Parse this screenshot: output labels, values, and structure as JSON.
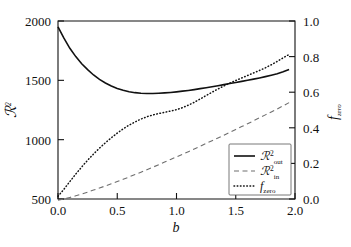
{
  "figure": {
    "background": "#ffffff",
    "foreground": "#111111",
    "dashed_color": "#6f6f6f"
  },
  "axes": {
    "left": {
      "label": "ℛ²",
      "label_base": "ℛ",
      "label_sup": "2",
      "ticks": [
        "500",
        "1000",
        "1500",
        "2000"
      ],
      "tick_values": [
        500,
        1000,
        1500,
        2000
      ],
      "min": 500,
      "max": 2000
    },
    "right": {
      "label_base": "f",
      "label_sub": "zero",
      "ticks": [
        "0.0",
        "0.2",
        "0.4",
        "0.6",
        "0.8",
        "1.0"
      ],
      "tick_values": [
        0.0,
        0.2,
        0.4,
        0.6,
        0.8,
        1.0
      ],
      "min": 0.0,
      "max": 1.0
    },
    "bottom": {
      "label": "b",
      "ticks": [
        "0.0",
        "0.5",
        "1.0",
        "1.5",
        "2.0"
      ],
      "tick_values": [
        0.0,
        0.5,
        1.0,
        1.5,
        2.0
      ],
      "min": 0.0,
      "max": 2.0
    }
  },
  "legend": {
    "position": "lower-right",
    "entries": [
      {
        "style": "solid",
        "base": "ℛ",
        "sup": "2",
        "sub": "out",
        "label": "ℛ²_out"
      },
      {
        "style": "dashed",
        "base": "ℛ",
        "sup": "2",
        "sub": "in",
        "label": "ℛ²_in"
      },
      {
        "style": "dotted",
        "base": "f",
        "sup": "",
        "sub": "zero",
        "label": "f_zero"
      }
    ]
  },
  "chart_data": {
    "type": "line",
    "title": "",
    "xlabel": "b",
    "ylabel": "ℛ²",
    "y2label": "f_zero",
    "xlim": [
      0.0,
      2.0
    ],
    "ylim": [
      500,
      2000
    ],
    "y2lim": [
      0.0,
      1.0
    ],
    "grid": false,
    "legend_position": "lower-right",
    "x": [
      0.0,
      0.05,
      0.1,
      0.15,
      0.2,
      0.25,
      0.3,
      0.35,
      0.4,
      0.45,
      0.5,
      0.55,
      0.6,
      0.65,
      0.7,
      0.75,
      0.8,
      0.85,
      0.9,
      0.95,
      1.0,
      1.05,
      1.1,
      1.15,
      1.2,
      1.25,
      1.3,
      1.35,
      1.4,
      1.45,
      1.5,
      1.55,
      1.6,
      1.65,
      1.7,
      1.75,
      1.8,
      1.85,
      1.9,
      1.95
    ],
    "series": [
      {
        "name": "ℛ²_out",
        "style": "solid",
        "axis": "left",
        "values": [
          1950,
          1855,
          1770,
          1700,
          1640,
          1590,
          1545,
          1508,
          1478,
          1453,
          1432,
          1416,
          1404,
          1396,
          1391,
          1389,
          1389,
          1391,
          1394,
          1398,
          1403,
          1409,
          1415,
          1422,
          1430,
          1438,
          1446,
          1455,
          1464,
          1473,
          1482,
          1491,
          1500,
          1510,
          1520,
          1531,
          1543,
          1556,
          1572,
          1592
        ]
      },
      {
        "name": "ℛ²_in",
        "style": "dashed",
        "axis": "left",
        "values": [
          490,
          500,
          513,
          527,
          542,
          558,
          575,
          592,
          610,
          628,
          647,
          666,
          686,
          706,
          726,
          747,
          768,
          789,
          811,
          833,
          855,
          877,
          899,
          922,
          945,
          968,
          991,
          1014,
          1038,
          1062,
          1086,
          1110,
          1134,
          1159,
          1184,
          1209,
          1234,
          1259,
          1285,
          1312
        ]
      },
      {
        "name": "f_zero",
        "style": "dotted",
        "axis": "right",
        "values": [
          0.015,
          0.055,
          0.098,
          0.14,
          0.18,
          0.218,
          0.253,
          0.286,
          0.316,
          0.344,
          0.37,
          0.394,
          0.415,
          0.433,
          0.449,
          0.462,
          0.472,
          0.48,
          0.487,
          0.494,
          0.502,
          0.513,
          0.527,
          0.543,
          0.562,
          0.581,
          0.6,
          0.618,
          0.635,
          0.651,
          0.666,
          0.68,
          0.694,
          0.708,
          0.722,
          0.737,
          0.754,
          0.773,
          0.793,
          0.812
        ]
      }
    ]
  }
}
